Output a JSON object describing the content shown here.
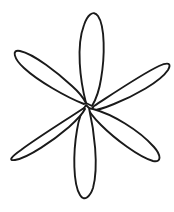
{
  "image": {
    "subject": "flower-line-drawing",
    "description": "Hand-drawn outline of a six-petal flower",
    "style": "black ink line art on plain white background",
    "width": 174,
    "height": 212,
    "background_color": "#ffffff",
    "stroke_color": "#1a1a1a",
    "fill_color": "#ffffff",
    "stroke_width": 1.9,
    "petal_count": 6,
    "center": {
      "x": 88,
      "y": 104
    }
  },
  "petals": [
    {
      "name": "top-petal",
      "label": "Top petal",
      "tip": {
        "x": 91,
        "y": 11
      },
      "angle_deg": 272,
      "path": "M 86 103 C 80 80 76 46 84 25 C 87 16 93 9 98 16 C 105 26 105 56 101 79 C 99 92 95 101 92 106 Z"
    },
    {
      "name": "upper-right-petal",
      "label": "Upper right petal",
      "tip": {
        "x": 168,
        "y": 57
      },
      "angle_deg": 333,
      "path": "M 94 106 C 114 93 142 74 159 66 C 168 62 172 63 168 70 C 160 82 134 96 114 104 C 102 109 95 111 91 110 Z"
    },
    {
      "name": "lower-right-petal",
      "label": "Lower right petal",
      "tip": {
        "x": 160,
        "y": 165
      },
      "angle_deg": 27,
      "path": "M 93 109 C 112 114 139 130 154 147 C 161 155 162 163 153 161 C 139 157 115 139 101 125 C 93 117 89 112 88 108 Z"
    },
    {
      "name": "bottom-petal",
      "label": "Bottom petal",
      "tip": {
        "x": 85,
        "y": 200
      },
      "angle_deg": 90,
      "path": "M 89 108 C 94 130 99 166 93 188 C 90 197 84 202 80 195 C 73 184 73 153 77 130 C 79 117 83 109 86 105 Z"
    },
    {
      "name": "lower-left-petal",
      "label": "Lower left petal",
      "tip": {
        "x": 9,
        "y": 157
      },
      "angle_deg": 153,
      "path": "M 84 108 C 66 120 37 138 21 150 C 11 157 8 161 15 160 C 28 158 54 140 69 127 C 79 118 83 113 85 109 Z"
    },
    {
      "name": "upper-left-petal",
      "label": "Upper left petal",
      "tip": {
        "x": 14,
        "y": 46
      },
      "angle_deg": 207,
      "path": "M 84 104 C 66 97 38 81 24 68 C 14 59 11 49 20 51 C 34 54 58 73 72 86 C 81 94 84 99 86 103 Z"
    }
  ]
}
